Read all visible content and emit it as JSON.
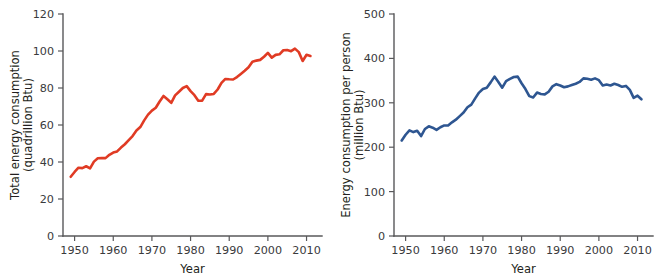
{
  "figure": {
    "background_color": "#ffffff",
    "panels": [
      "left",
      "right"
    ]
  },
  "chart_data": [
    {
      "type": "line",
      "panel": "left",
      "title": "",
      "xlabel": "Year",
      "ylabel": "Total energy consumption (quadrillion Btu)",
      "ylabel_line1": "Total energy consumption",
      "ylabel_line2": "(quadrillion Btu)",
      "series_color": "#e03b24",
      "grid": false,
      "legend": "none",
      "xlim": [
        1947,
        2014
      ],
      "ylim": [
        0,
        120
      ],
      "xticks": [
        1950,
        1960,
        1970,
        1980,
        1990,
        2000,
        2010
      ],
      "xticklabels": [
        "1950",
        "1960",
        "1970",
        "1980",
        "1990",
        "2000",
        "2010"
      ],
      "yticks": [
        0,
        20,
        40,
        60,
        80,
        100,
        120
      ],
      "yticklabels": [
        "0",
        "20",
        "40",
        "60",
        "80",
        "100",
        "120"
      ],
      "series": [
        {
          "name": "Total energy consumption",
          "x": [
            1949,
            1950,
            1951,
            1952,
            1953,
            1954,
            1955,
            1956,
            1957,
            1958,
            1959,
            1960,
            1961,
            1962,
            1963,
            1964,
            1965,
            1966,
            1967,
            1968,
            1969,
            1970,
            1971,
            1972,
            1973,
            1974,
            1975,
            1976,
            1977,
            1978,
            1979,
            1980,
            1981,
            1982,
            1983,
            1984,
            1985,
            1986,
            1987,
            1988,
            1989,
            1990,
            1991,
            1992,
            1993,
            1994,
            1995,
            1996,
            1997,
            1998,
            1999,
            2000,
            2001,
            2002,
            2003,
            2004,
            2005,
            2006,
            2007,
            2008,
            2009,
            2010,
            2011
          ],
          "values": [
            32.0,
            34.6,
            36.9,
            36.7,
            37.7,
            36.6,
            40.2,
            42.0,
            42.2,
            42.1,
            43.9,
            45.1,
            45.7,
            47.8,
            49.6,
            51.8,
            54.0,
            57.0,
            58.9,
            62.5,
            65.6,
            67.8,
            69.3,
            72.7,
            75.7,
            73.9,
            72.0,
            76.0,
            78.0,
            80.0,
            81.0,
            78.3,
            76.1,
            73.1,
            73.2,
            76.7,
            76.5,
            76.8,
            79.2,
            82.8,
            84.9,
            84.7,
            84.6,
            85.9,
            87.6,
            89.3,
            91.2,
            94.2,
            94.8,
            95.2,
            96.9,
            99.0,
            96.4,
            97.9,
            98.2,
            100.4,
            100.5,
            99.9,
            101.3,
            99.4,
            94.6,
            98.0,
            97.3
          ],
          "color": "#e03b24"
        }
      ]
    },
    {
      "type": "line",
      "panel": "right",
      "title": "",
      "xlabel": "Year",
      "ylabel": "Energy consumption per person (million Btu)",
      "ylabel_line1": "Energy consumption per person",
      "ylabel_line2": "(million Btu)",
      "series_color": "#2e5691",
      "grid": false,
      "legend": "none",
      "xlim": [
        1947,
        2014
      ],
      "ylim": [
        0,
        500
      ],
      "xticks": [
        1950,
        1960,
        1970,
        1980,
        1990,
        2000,
        2010
      ],
      "xticklabels": [
        "1950",
        "1960",
        "1970",
        "1980",
        "1990",
        "2000",
        "2010"
      ],
      "yticks": [
        0,
        100,
        200,
        300,
        400,
        500
      ],
      "yticklabels": [
        "0",
        "100",
        "200",
        "300",
        "400",
        "500"
      ],
      "series": [
        {
          "name": "Energy consumption per person",
          "x": [
            1949,
            1950,
            1951,
            1952,
            1953,
            1954,
            1955,
            1956,
            1957,
            1958,
            1959,
            1960,
            1961,
            1962,
            1963,
            1964,
            1965,
            1966,
            1967,
            1968,
            1969,
            1970,
            1971,
            1972,
            1973,
            1974,
            1975,
            1976,
            1977,
            1978,
            1979,
            1980,
            1981,
            1982,
            1983,
            1984,
            1985,
            1986,
            1987,
            1988,
            1989,
            1990,
            1991,
            1992,
            1993,
            1994,
            1995,
            1996,
            1997,
            1998,
            1999,
            2000,
            2001,
            2002,
            2003,
            2004,
            2005,
            2006,
            2007,
            2008,
            2009,
            2010,
            2011
          ],
          "values": [
            215,
            228,
            238,
            234,
            237,
            225,
            241,
            247,
            244,
            239,
            245,
            249,
            249,
            256,
            262,
            270,
            278,
            290,
            296,
            310,
            323,
            331,
            334,
            346,
            359,
            347,
            334,
            349,
            354,
            358,
            359,
            344,
            331,
            315,
            312,
            323,
            320,
            319,
            325,
            337,
            342,
            339,
            335,
            337,
            340,
            343,
            347,
            355,
            354,
            352,
            355,
            351,
            339,
            341,
            339,
            343,
            340,
            336,
            338,
            329,
            311,
            316,
            308
          ],
          "color": "#2e5691"
        }
      ]
    }
  ]
}
